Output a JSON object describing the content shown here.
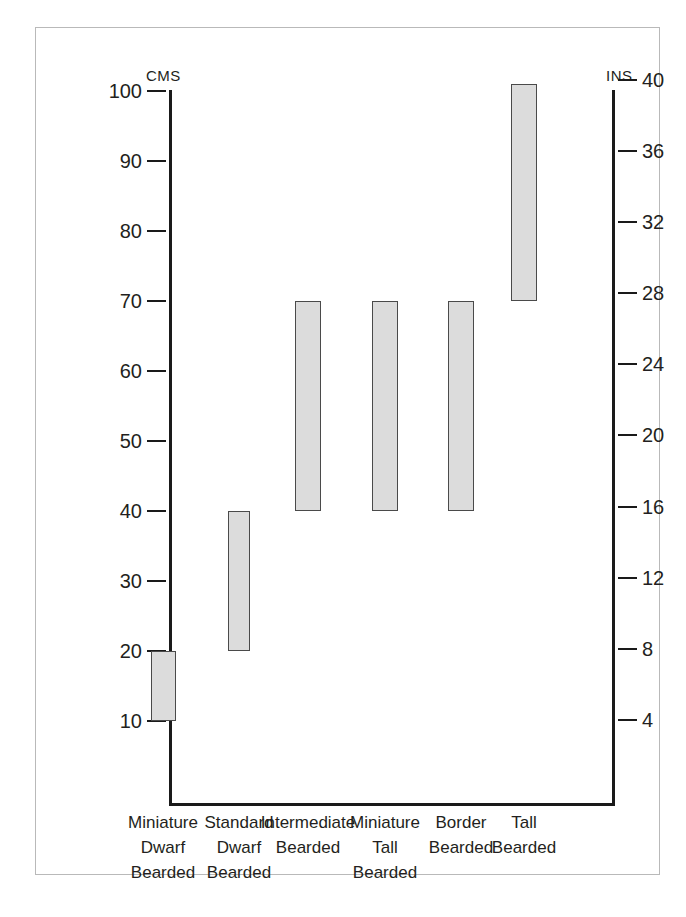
{
  "gutter_text": [
    "s",
    "-",
    "s",
    "t",
    "e",
    "-",
    "r",
    "5",
    "l",
    "e",
    "n"
  ],
  "chart_data": {
    "type": "bar",
    "title": "",
    "subtitle": "",
    "xlabel": "",
    "ylabel": "CMS",
    "y2label": "INS",
    "grid": false,
    "legend": "none",
    "orientation": "vertical",
    "bar_style": "floating range bars (min-max height)",
    "ylim": [
      0,
      105
    ],
    "y2lim": [
      0,
      41.3
    ],
    "yticks": [
      100,
      90,
      80,
      70,
      60,
      50,
      40,
      30,
      20,
      10
    ],
    "y2ticks": [
      40,
      36,
      32,
      28,
      24,
      20,
      16,
      12,
      8,
      4
    ],
    "ytick_labels": [
      "100",
      "90",
      "80",
      "70",
      "60",
      "50",
      "40",
      "30",
      "20",
      "10"
    ],
    "y2tick_labels": [
      "40",
      "36",
      "32",
      "28",
      "24",
      "20",
      "16",
      "12",
      "8",
      "4"
    ],
    "categories": [
      "Miniature Dwarf Bearded",
      "Standard Dwarf Bearded",
      "Intermediate Bearded",
      "Miniature Tall Bearded",
      "Border Bearded",
      "Tall Bearded"
    ],
    "category_lines": [
      [
        "Miniature",
        "Dwarf",
        "Bearded"
      ],
      [
        "Standard",
        "Dwarf",
        "Bearded"
      ],
      [
        "Intermediate",
        "Bearded"
      ],
      [
        "Miniature",
        "Tall",
        "Bearded"
      ],
      [
        "Border",
        "Bearded"
      ],
      [
        "Tall",
        "Bearded"
      ]
    ],
    "series": [
      {
        "name": "Height range (cm)",
        "units": "cm",
        "low": [
          10,
          20,
          40,
          40,
          40,
          70
        ],
        "high": [
          20,
          40,
          70,
          70,
          70,
          101
        ]
      },
      {
        "name": "Height range (in)",
        "units": "in",
        "low": [
          4,
          8,
          16,
          16,
          16,
          28
        ],
        "high": [
          8,
          16,
          28,
          28,
          28,
          40
        ]
      }
    ],
    "colors": {
      "bar_fill": "#dcdcdc",
      "bar_border": "#4a4a4a",
      "axis": "#1a1a1a",
      "text": "#231f20",
      "frame": "#b9b9b9",
      "background": "#ffffff"
    }
  }
}
